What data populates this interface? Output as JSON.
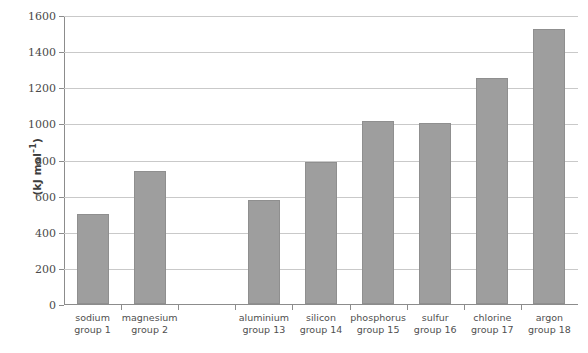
{
  "chart_data": {
    "type": "bar",
    "title": "",
    "xlabel": "",
    "ylabel": "(kJ mol⁻¹)",
    "ylabel_main": "(kJ mol",
    "ylabel_sup": "–1",
    "ylabel_tail": ")",
    "ylim": [
      0,
      1600
    ],
    "ytick_step": 200,
    "yticks": [
      "0",
      "200",
      "400",
      "600",
      "800",
      "1000",
      "1200",
      "1400",
      "1600"
    ],
    "grid": true,
    "legend": "none",
    "categories": [
      "sodium",
      "magnesium",
      "aluminium",
      "silicon",
      "phosphorus",
      "sulfur",
      "chlorine",
      "argon"
    ],
    "category_sublabels": [
      "group 1",
      "group 2",
      "group 13",
      "group 14",
      "group 15",
      "group 16",
      "group 17",
      "group 18"
    ],
    "values": [
      496,
      738,
      578,
      789,
      1012,
      1000,
      1251,
      1521
    ],
    "bars": [
      {
        "name": "sodium",
        "sublabel": "group 1",
        "value": 496,
        "slot": 0
      },
      {
        "name": "magnesium",
        "sublabel": "group 2",
        "value": 738,
        "slot": 1
      },
      {
        "name": "aluminium",
        "sublabel": "group 13",
        "value": 578,
        "slot": 3
      },
      {
        "name": "silicon",
        "sublabel": "group 14",
        "value": 789,
        "slot": 4
      },
      {
        "name": "phosphorus",
        "sublabel": "group 15",
        "value": 1012,
        "slot": 5
      },
      {
        "name": "sulfur",
        "sublabel": "group 16",
        "value": 1000,
        "slot": 6
      },
      {
        "name": "chlorine",
        "sublabel": "group 17",
        "value": 1251,
        "slot": 7
      },
      {
        "name": "argon",
        "sublabel": "group 18",
        "value": 1521,
        "slot": 8
      }
    ],
    "slot_count": 9,
    "empty_slots": [
      2
    ],
    "bar_color": "#9e9e9e",
    "bar_border_color": "#8f8f8f",
    "gridline_color": "#c9c9c9",
    "axis_color": "#8c8c8c"
  }
}
